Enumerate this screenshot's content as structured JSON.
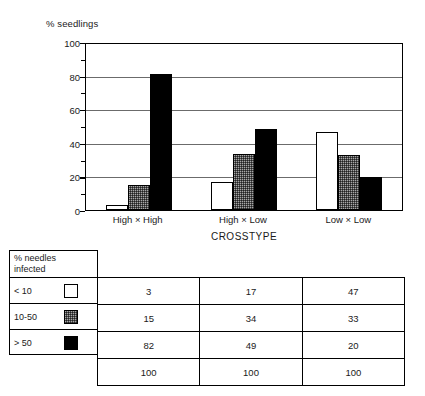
{
  "chart_data": {
    "type": "bar",
    "title": "",
    "xlabel": "CROSSTYPE",
    "ylabel": "% seedlings",
    "categories": [
      "High × High",
      "High × Low",
      "Low × Low"
    ],
    "series": [
      {
        "name": "< 10",
        "swatch": "white",
        "color": "#ffffff",
        "values": [
          3,
          17,
          47
        ]
      },
      {
        "name": "10-50",
        "swatch": "gray",
        "color": "#a8a8a8",
        "values": [
          15,
          34,
          33
        ]
      },
      {
        "name": "> 50",
        "swatch": "black",
        "color": "#000000",
        "values": [
          82,
          49,
          20
        ]
      }
    ],
    "ylim": [
      0,
      100
    ],
    "yticks": [
      0,
      20,
      40,
      60,
      80,
      100
    ],
    "ytick_labels": [
      "0",
      "20",
      "40",
      "60",
      "80",
      "100"
    ],
    "minor_ticks": [
      10,
      30,
      50,
      70,
      90
    ],
    "grid": "horizontal",
    "legend_position": "below-left-in-table"
  },
  "legend": {
    "header_line1": "% needles",
    "header_line2": "infected",
    "rows": [
      {
        "label": "< 10",
        "swatch": "white"
      },
      {
        "label": "10-50",
        "swatch": "gray"
      },
      {
        "label": "> 50",
        "swatch": "black"
      }
    ]
  },
  "table": {
    "rows": [
      {
        "label": "< 10",
        "cells": [
          "3",
          "17",
          "47"
        ]
      },
      {
        "label": "10-50",
        "cells": [
          "15",
          "34",
          "33"
        ]
      },
      {
        "label": "> 50",
        "cells": [
          "82",
          "49",
          "20"
        ]
      }
    ],
    "total_row": {
      "cells": [
        "100",
        "100",
        "100"
      ]
    }
  }
}
